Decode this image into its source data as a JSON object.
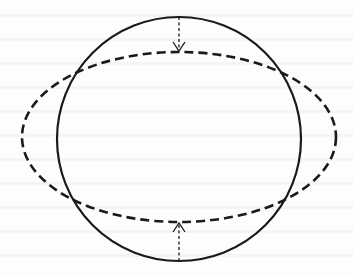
{
  "diagram": {
    "type": "geometric-deformation",
    "colors": {
      "stroke": "#1a1a1a",
      "background": "#fdfdfd"
    },
    "circle": {
      "style": "solid",
      "cx": 179,
      "cy": 139,
      "r": 122,
      "stroke_width": 2.2
    },
    "ellipse": {
      "style": "dashed",
      "cx": 179,
      "cy": 137,
      "rx": 157,
      "ry": 85,
      "stroke_width": 2.6,
      "dash": "9 5"
    },
    "arrows": [
      {
        "name": "top-compression-arrow",
        "direction": "down",
        "x": 179,
        "y1": 17,
        "y2": 50
      },
      {
        "name": "bottom-compression-arrow",
        "direction": "up",
        "x": 179,
        "y1": 261,
        "y2": 224
      }
    ]
  }
}
